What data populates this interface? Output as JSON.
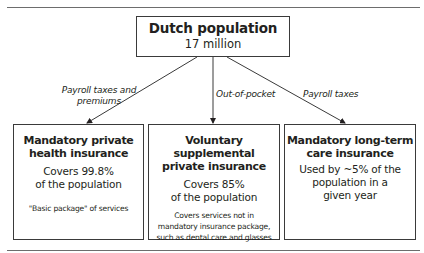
{
  "diagram": {
    "root": {
      "title": "Dutch population",
      "subtitle": "17 million"
    },
    "edges": [
      {
        "label_line1": "Payroll taxes and",
        "label_line2": "premiums",
        "target": "Mandatory private health insurance"
      },
      {
        "label": "Out-of-pocket",
        "target": "Voluntary supplemental private insurance"
      },
      {
        "label": "Payroll taxes",
        "target": "Mandatory long-term care insurance"
      }
    ],
    "boxes": [
      {
        "title_line1": "Mandatory private",
        "title_line2": "health insurance",
        "coverage_line1": "Covers 99.8%",
        "coverage_line2": "of the population",
        "note_line1": "\"Basic package\" of services"
      },
      {
        "title_line1": "Voluntary supplemental",
        "title_line2": "private insurance",
        "coverage_line1": "Covers 85%",
        "coverage_line2": "of the population",
        "note_line1": "Covers services not in",
        "note_line2": "mandatory insurance package,",
        "note_line3": "such as dental care and glasses"
      },
      {
        "title_line1": "Mandatory long-term",
        "title_line2": "care insurance",
        "coverage_line1": "Used by ~5% of the",
        "coverage_line2": "population in a",
        "coverage_line3": "given year"
      }
    ]
  },
  "colors": {
    "line": "#3a3a3a",
    "text": "#231f20",
    "rule": "#6d6d6d"
  }
}
